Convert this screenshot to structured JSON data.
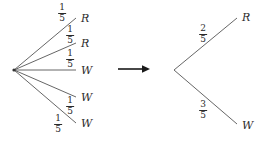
{
  "diagram": {
    "stroke_color": "#555555",
    "text_color": "#2b2b2b",
    "background": "#ffffff",
    "arrow": {
      "symbol": "right-arrow",
      "label": ""
    },
    "left_tree": {
      "root_label": "",
      "branches": [
        {
          "probability_numerator": "1",
          "probability_denominator": "5",
          "outcome": "R"
        },
        {
          "probability_numerator": "1",
          "probability_denominator": "5",
          "outcome": "R"
        },
        {
          "probability_numerator": "1",
          "probability_denominator": "5",
          "outcome": "W"
        },
        {
          "probability_numerator": "1",
          "probability_denominator": "5",
          "outcome": "W"
        },
        {
          "probability_numerator": "1",
          "probability_denominator": "5",
          "outcome": "W"
        }
      ]
    },
    "right_tree": {
      "root_label": "",
      "branches": [
        {
          "probability_numerator": "2",
          "probability_denominator": "5",
          "outcome": "R"
        },
        {
          "probability_numerator": "3",
          "probability_denominator": "5",
          "outcome": "W"
        }
      ]
    }
  }
}
